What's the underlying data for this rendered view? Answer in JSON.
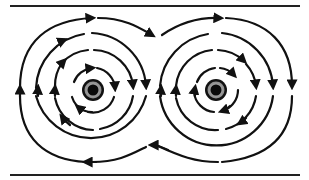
{
  "diagram": {
    "title": "Magnetic field lines around two parallel current-carrying conductors",
    "colors": {
      "line": "#111111",
      "conductor_outer": "#111111",
      "conductor_mid": "#9a9a9a",
      "conductor_core": "#0a0a0a",
      "background": "#ffffff"
    },
    "boundaries": [
      {
        "name": "top-line",
        "y": 6,
        "x1": 10,
        "x2": 300
      },
      {
        "name": "bottom-line",
        "y": 175,
        "x1": 10,
        "x2": 300
      }
    ],
    "conductors": [
      {
        "name": "left-conductor",
        "cx": 93,
        "cy": 90
      },
      {
        "name": "right-conductor",
        "cx": 216,
        "cy": 90
      }
    ],
    "field_direction": "clockwise",
    "ring_radii": [
      22,
      40,
      57
    ],
    "outer_envelope": true
  }
}
